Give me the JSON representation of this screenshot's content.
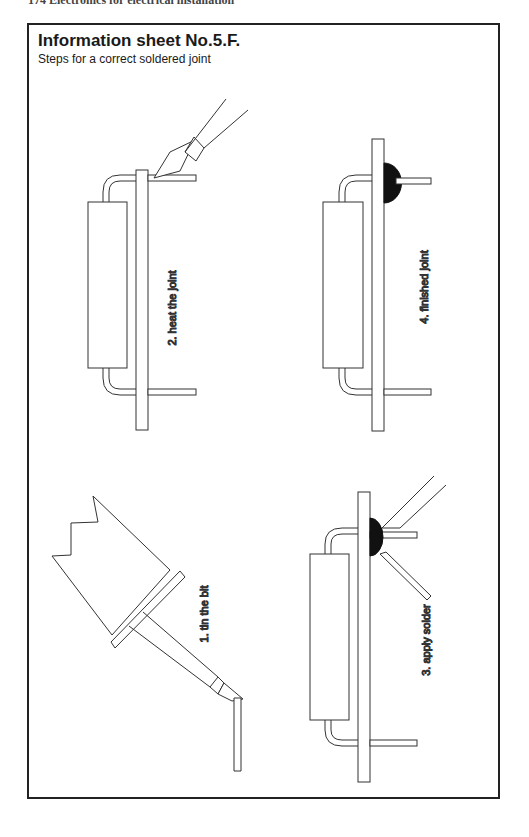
{
  "running_head": "174   Electronics for electrical installation",
  "sheet": {
    "title": "Information sheet No.5.F.",
    "subtitle": "Steps for a correct soldered joint"
  },
  "steps": [
    {
      "number": 1,
      "label": "1. tin the bit"
    },
    {
      "number": 2,
      "label": "2. heat the joint"
    },
    {
      "number": 3,
      "label": "3. apply solder"
    },
    {
      "number": 4,
      "label": "4. finished joint"
    }
  ],
  "colors": {
    "line": "#333333",
    "solder": "#111111",
    "border": "#222222"
  }
}
